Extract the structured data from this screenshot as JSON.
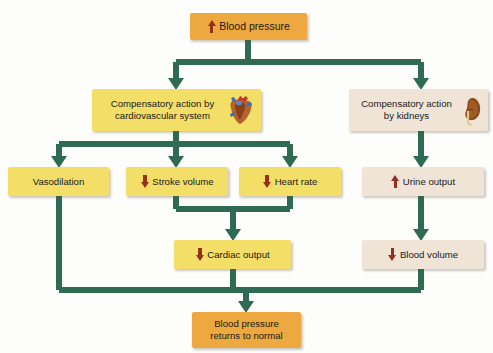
{
  "diagram": {
    "colors": {
      "connector": "#2f6b52",
      "orange_box": "#eda93f",
      "yellow_box": "#f3de68",
      "cream_box": "#f0e4d6",
      "arrow_red": "#95301b",
      "background": "#fdfdfb"
    },
    "nodes": [
      {
        "id": "blood-pressure-rise",
        "label": "Blood pressure",
        "indicator": "up",
        "fill": "orange",
        "x": 190,
        "y": 13,
        "w": 117,
        "h": 27,
        "font_size": 10.5
      },
      {
        "id": "compensatory-cardiovascular",
        "label": "Compensatory action by\ncardiovascular system",
        "indicator": "none",
        "icon": "heart-illustration",
        "fill": "yellow",
        "x": 92,
        "y": 89,
        "w": 169,
        "h": 42,
        "font_size": 9.6
      },
      {
        "id": "compensatory-kidneys",
        "label": "Compensatory action\nby kidneys",
        "indicator": "none",
        "icon": "kidney-illustration",
        "fill": "cream",
        "x": 349,
        "y": 89,
        "w": 139,
        "h": 42,
        "font_size": 9.6
      },
      {
        "id": "vasodilation",
        "label": "Vasodilation",
        "indicator": "none",
        "fill": "yellow",
        "x": 8,
        "y": 167,
        "w": 101,
        "h": 29,
        "font_size": 9.6
      },
      {
        "id": "stroke-volume",
        "label": "Stroke volume",
        "indicator": "down",
        "fill": "yellow",
        "x": 126,
        "y": 167,
        "w": 102,
        "h": 29,
        "font_size": 9.6
      },
      {
        "id": "heart-rate",
        "label": "Heart rate",
        "indicator": "down",
        "fill": "yellow",
        "x": 239,
        "y": 167,
        "w": 102,
        "h": 29,
        "font_size": 9.6
      },
      {
        "id": "urine-output",
        "label": "Urine output",
        "indicator": "up",
        "fill": "cream",
        "x": 362,
        "y": 167,
        "w": 122,
        "h": 29,
        "font_size": 9.6
      },
      {
        "id": "cardiac-output",
        "label": "Cardiac output",
        "indicator": "down",
        "fill": "yellow",
        "x": 174,
        "y": 240,
        "w": 117,
        "h": 29,
        "font_size": 9.6
      },
      {
        "id": "blood-volume",
        "label": "Blood volume",
        "indicator": "down",
        "fill": "cream",
        "x": 362,
        "y": 240,
        "w": 122,
        "h": 29,
        "font_size": 9.6
      },
      {
        "id": "blood-pressure-normal",
        "label": "Blood pressure\nreturns to normal",
        "indicator": "none",
        "fill": "orange",
        "x": 192,
        "y": 312,
        "w": 109,
        "h": 36,
        "font_size": 9.6
      }
    ],
    "edges": [
      {
        "id": "bp-to-split",
        "from": "blood-pressure-rise",
        "to": "branch-bus-1"
      },
      {
        "id": "split-to-cardiovascular",
        "from": "branch-bus-1",
        "to": "compensatory-cardiovascular"
      },
      {
        "id": "split-to-kidneys",
        "from": "branch-bus-1",
        "to": "compensatory-kidneys"
      },
      {
        "id": "cv-to-vasodilation",
        "from": "compensatory-cardiovascular",
        "to": "vasodilation"
      },
      {
        "id": "cv-to-stroke-volume",
        "from": "compensatory-cardiovascular",
        "to": "stroke-volume"
      },
      {
        "id": "cv-to-heart-rate",
        "from": "compensatory-cardiovascular",
        "to": "heart-rate"
      },
      {
        "id": "kidneys-to-urine-output",
        "from": "compensatory-kidneys",
        "to": "urine-output"
      },
      {
        "id": "sv-hr-to-cardiac-output",
        "from": "stroke-volume",
        "to": "cardiac-output"
      },
      {
        "id": "urine-to-blood-volume",
        "from": "urine-output",
        "to": "blood-volume"
      },
      {
        "id": "vasodilation-to-bottom",
        "from": "vasodilation",
        "to": "blood-pressure-normal"
      },
      {
        "id": "cardiac-output-to-bottom",
        "from": "cardiac-output",
        "to": "blood-pressure-normal"
      },
      {
        "id": "blood-volume-to-bottom",
        "from": "blood-volume",
        "to": "blood-pressure-normal"
      }
    ]
  }
}
